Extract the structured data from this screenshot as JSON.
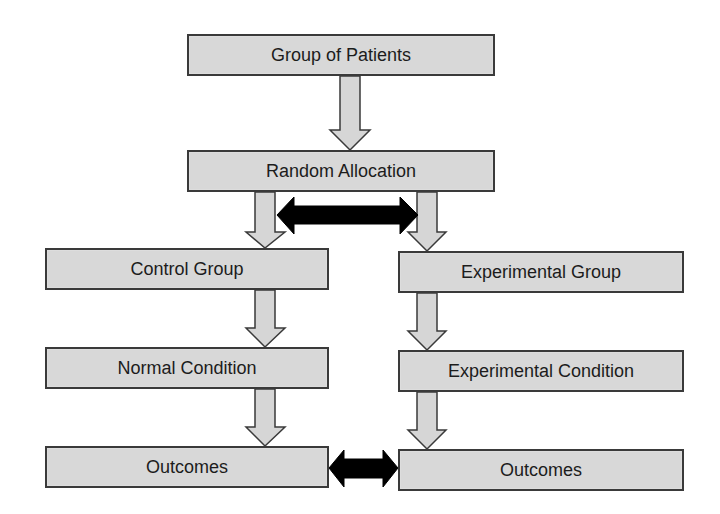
{
  "diagram": {
    "type": "flowchart",
    "colors": {
      "box_fill": "#d8d8d8",
      "box_border": "#3a3a3a",
      "arrow_fill": "#d6d6d6",
      "comparison_arrow": "#000000",
      "text": "#1c1c1c"
    },
    "nodes": {
      "patients": {
        "label": "Group of Patients"
      },
      "random": {
        "label": "Random Allocation"
      },
      "control_group": {
        "label": "Control Group"
      },
      "experimental_group": {
        "label": "Experimental Group"
      },
      "normal_condition": {
        "label": "Normal Condition"
      },
      "experimental_condition": {
        "label": "Experimental Condition"
      },
      "control_outcomes": {
        "label": "Outcomes"
      },
      "experimental_outcomes": {
        "label": "Outcomes"
      }
    },
    "edges": [
      {
        "from": "Group of Patients",
        "to": "Random Allocation",
        "style": "down-arrow"
      },
      {
        "from": "Random Allocation",
        "to": "Control Group",
        "style": "down-arrow"
      },
      {
        "from": "Random Allocation",
        "to": "Experimental Group",
        "style": "down-arrow"
      },
      {
        "from": "Control Group",
        "to": "Normal Condition",
        "style": "down-arrow"
      },
      {
        "from": "Experimental Group",
        "to": "Experimental Condition",
        "style": "down-arrow"
      },
      {
        "from": "Normal Condition",
        "to": "Outcomes (control)",
        "style": "down-arrow"
      },
      {
        "from": "Experimental Condition",
        "to": "Outcomes (experimental)",
        "style": "down-arrow"
      },
      {
        "between": [
          "Control branch",
          "Experimental branch"
        ],
        "style": "double-arrow",
        "position": "after allocation"
      },
      {
        "between": [
          "Outcomes (control)",
          "Outcomes (experimental)"
        ],
        "style": "double-arrow",
        "position": "outcomes comparison"
      }
    ]
  }
}
